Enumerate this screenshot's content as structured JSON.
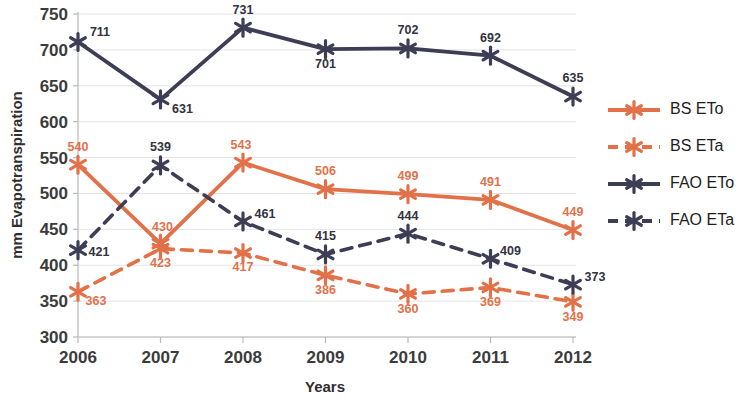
{
  "chart_data": {
    "type": "line",
    "title": "",
    "xlabel": "Years",
    "ylabel": "mm Evapotranspiration",
    "categories": [
      "2006",
      "2007",
      "2008",
      "2009",
      "2010",
      "2011",
      "2012"
    ],
    "x": [
      2006,
      2007,
      2008,
      2009,
      2010,
      2011,
      2012
    ],
    "ylim": [
      300,
      750
    ],
    "yticks": [
      300,
      350,
      400,
      450,
      500,
      550,
      600,
      650,
      700,
      750
    ],
    "grid": true,
    "legend_position": "right",
    "series": [
      {
        "name": "BS ETo",
        "values": [
          540,
          430,
          543,
          506,
          499,
          491,
          449
        ],
        "color": "#e2714a",
        "style": "solid",
        "marker": "asterisk"
      },
      {
        "name": "BS ETa",
        "values": [
          363,
          423,
          417,
          386,
          360,
          369,
          349
        ],
        "color": "#e2714a",
        "style": "dashed",
        "marker": "asterisk"
      },
      {
        "name": "FAO ETo",
        "values": [
          711,
          631,
          731,
          701,
          702,
          692,
          635
        ],
        "color": "#3e3d56",
        "style": "solid",
        "marker": "asterisk"
      },
      {
        "name": "FAO ETa",
        "values": [
          421,
          539,
          461,
          415,
          444,
          409,
          373
        ],
        "color": "#3e3d56",
        "style": "dashed",
        "marker": "asterisk"
      }
    ],
    "data_labels": {
      "BS ETo": [
        {
          "v": 540,
          "dx": 0,
          "dy": -14
        },
        {
          "v": 430,
          "dx": 2,
          "dy": -13
        },
        {
          "v": 543,
          "dx": -2,
          "dy": -14
        },
        {
          "v": 506,
          "dx": 0,
          "dy": -14
        },
        {
          "v": 499,
          "dx": 0,
          "dy": -14
        },
        {
          "v": 491,
          "dx": 0,
          "dy": -14
        },
        {
          "v": 449,
          "dx": 0,
          "dy": -14
        }
      ],
      "BS ETa": [
        {
          "v": 363,
          "dx": 18,
          "dy": 13
        },
        {
          "v": 423,
          "dx": 0,
          "dy": 18
        },
        {
          "v": 417,
          "dx": 0,
          "dy": 18
        },
        {
          "v": 386,
          "dx": 0,
          "dy": 19
        },
        {
          "v": 360,
          "dx": 0,
          "dy": 19
        },
        {
          "v": 369,
          "dx": 0,
          "dy": 19
        },
        {
          "v": 349,
          "dx": 0,
          "dy": 19
        }
      ],
      "FAO ETo": [
        {
          "v": 711,
          "dx": 22,
          "dy": -6
        },
        {
          "v": 631,
          "dx": 22,
          "dy": 14
        },
        {
          "v": 731,
          "dx": 0,
          "dy": -14
        },
        {
          "v": 701,
          "dx": 0,
          "dy": 19
        },
        {
          "v": 702,
          "dx": 0,
          "dy": -14
        },
        {
          "v": 692,
          "dx": 0,
          "dy": -14
        },
        {
          "v": 635,
          "dx": 0,
          "dy": -15
        }
      ],
      "FAO ETa": [
        {
          "v": 421,
          "dx": 21,
          "dy": 6
        },
        {
          "v": 539,
          "dx": 0,
          "dy": -14
        },
        {
          "v": 461,
          "dx": 22,
          "dy": -3
        },
        {
          "v": 415,
          "dx": 0,
          "dy": -14
        },
        {
          "v": 444,
          "dx": 0,
          "dy": -14
        },
        {
          "v": 409,
          "dx": 20,
          "dy": -4
        },
        {
          "v": 373,
          "dx": 22,
          "dy": -4
        }
      ]
    }
  },
  "legend": {
    "items": [
      {
        "label": "BS ETo",
        "color": "#e2714a",
        "style": "solid"
      },
      {
        "label": "BS ETa",
        "color": "#e2714a",
        "style": "dashed"
      },
      {
        "label": "FAO ETo",
        "color": "#3e3d56",
        "style": "solid"
      },
      {
        "label": "FAO ETa",
        "color": "#3e3d56",
        "style": "dashed"
      }
    ]
  },
  "colors": {
    "bs": "#e2714a",
    "fao": "#3e3d56",
    "grid": "#e4e4e8",
    "axis": "#b9b9bd",
    "text": "#2e2e2e"
  }
}
